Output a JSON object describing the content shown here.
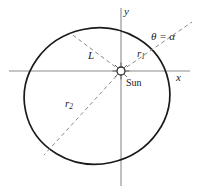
{
  "figure": {
    "type": "geometry-diagram",
    "width": 197,
    "height": 191,
    "background_color": "#ffffff",
    "curve_color": "#1a1a1a",
    "axis_color": "#888888",
    "dash_color": "#8a8a8a",
    "text_color": "#1a1a1a"
  },
  "axes": {
    "x_label": "x",
    "y_label": "y",
    "origin_px": [
      121,
      71
    ],
    "x_axis_px": {
      "x1": 9,
      "y1": 71,
      "x2": 190,
      "y2": 71
    },
    "y_axis_px": {
      "x1": 121,
      "y1": 8,
      "x2": 121,
      "y2": 186
    }
  },
  "orbit": {
    "name": "ellipse",
    "center_px": [
      97,
      96
    ],
    "semi_major_px": 73,
    "semi_minor_px": 68,
    "rotation_deg": -12,
    "stroke_width": 1.6
  },
  "focus": {
    "label": "Sun",
    "position_px": [
      121,
      71
    ],
    "marker": "sun-icon",
    "radius_px": 4,
    "ray_count": 8
  },
  "rays": [
    {
      "name": "r1",
      "label": "r₁",
      "label_text": "r",
      "label_sub": "1",
      "from_px": [
        121,
        71
      ],
      "to_px": [
        192,
        22
      ],
      "style": "dashed",
      "angle_label": "θ = α"
    },
    {
      "name": "r2",
      "label": "r₂",
      "label_text": "r",
      "label_sub": "2",
      "from_px": [
        121,
        71
      ],
      "to_px": [
        44,
        155
      ],
      "style": "dashed"
    },
    {
      "name": "L",
      "label": "L",
      "from_px": [
        121,
        71
      ],
      "to_px": [
        70,
        33
      ],
      "style": "dashed"
    }
  ],
  "labels": {
    "y": "y",
    "x": "x",
    "theta_equals_alpha": "θ = α",
    "r1_base": "r",
    "r1_sub": "1",
    "r2_base": "r",
    "r2_sub": "2",
    "L": "L",
    "sun": "Sun"
  }
}
